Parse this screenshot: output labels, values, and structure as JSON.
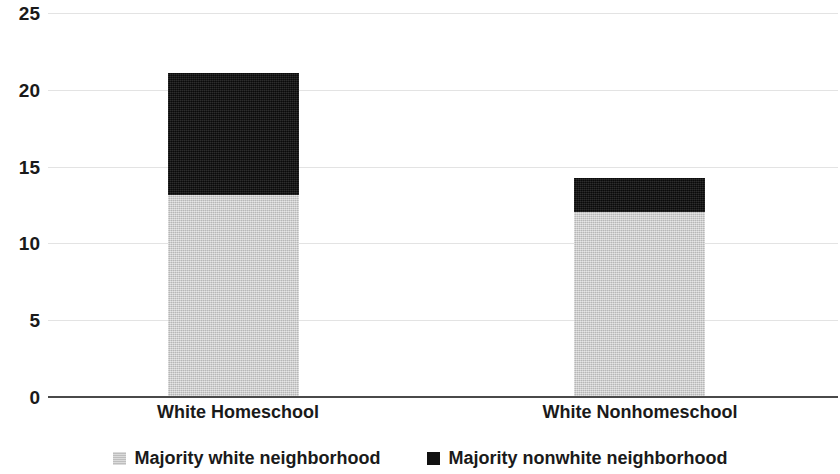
{
  "chart_data": {
    "type": "bar",
    "subtype": "stacked-vertical",
    "title": "",
    "subtitle": "",
    "xlabel": "",
    "ylabel": "",
    "categories": [
      "White Homeschool",
      "White Nonhomeschool"
    ],
    "series": [
      {
        "name": "Majority white neighborhood",
        "color": "#c8c8c8",
        "values": [
          13.1,
          12.0
        ]
      },
      {
        "name": "Majority nonwhite neighborhood",
        "color": "#111111",
        "values": [
          8.0,
          2.2
        ]
      }
    ],
    "totals": [
      21.1,
      14.2
    ],
    "ylim": [
      0,
      25
    ],
    "ytick_values": [
      0,
      5,
      10,
      15,
      20,
      25
    ],
    "ytick_labels": [
      "0",
      "5",
      "10",
      "15",
      "20",
      "25"
    ],
    "grid": true,
    "grid_axis": "y",
    "legend_position": "bottom",
    "legend_entries": [
      "Majority white neighborhood",
      "Majority nonwhite neighborhood"
    ],
    "annotations": []
  },
  "axes": {
    "y_ticks": [
      "25",
      "20",
      "15",
      "10",
      "5",
      "0"
    ]
  },
  "legend": {
    "items": [
      {
        "label": "Majority white neighborhood",
        "swatch": "legend-swatch-white"
      },
      {
        "label": "Majority nonwhite neighborhood",
        "swatch": "legend-swatch-nonwhite"
      }
    ]
  }
}
